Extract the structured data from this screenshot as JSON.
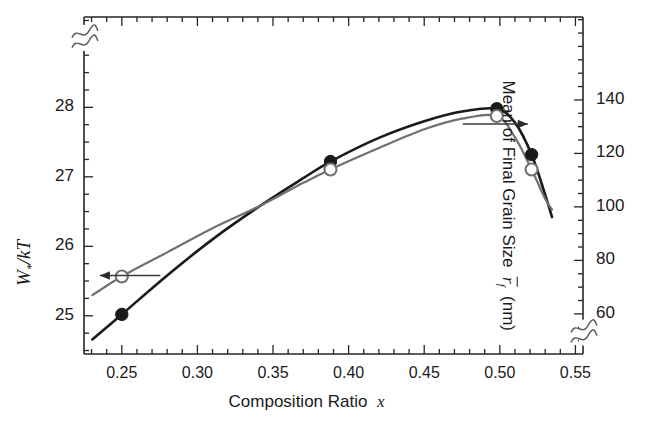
{
  "figure": {
    "background": "#ffffff",
    "axis_color": "#262626",
    "series_colors": {
      "left_axis_curve": "#1a1a1a",
      "right_axis_curve": "#707070"
    }
  },
  "chart_data": {
    "type": "line",
    "title": "",
    "subtitle": "",
    "xlabel_prefix": "Composition Ratio",
    "xlabel_symbol": "x",
    "xlim": [
      0.225,
      0.555
    ],
    "xticks": [
      0.25,
      0.3,
      0.35,
      0.4,
      0.45,
      0.5,
      0.55
    ],
    "xticklabels": [
      "0.25",
      "0.30",
      "0.35",
      "0.40",
      "0.45",
      "0.50",
      "0.55"
    ],
    "x_minor_tick_step": 0.01,
    "grid": false,
    "legend": "none",
    "axis_break_left": true,
    "axis_break_right": true,
    "left_axis": {
      "ylabel_plain": "W*/kT",
      "ylabel_base": "W",
      "ylabel_sub": "*",
      "ylabel_rest": "/kT",
      "ylim": [
        24.45,
        29.3
      ],
      "yticks": [
        25,
        26,
        27,
        28
      ],
      "yticklabels": [
        "25",
        "26",
        "27",
        "28"
      ],
      "y_minor_tick_step": 0.25,
      "break_value": 29.0
    },
    "right_axis": {
      "ylabel_prefix": "Mean of Final Grain Size",
      "ylabel_symbol_base": "r",
      "ylabel_symbol_sub": "f",
      "ylabel_symbol_overbar": true,
      "ylabel_units": "(nm)",
      "ylim": [
        45,
        171
      ],
      "yticks": [
        60,
        80,
        100,
        120,
        140
      ],
      "yticklabels": [
        "60",
        "80",
        "100",
        "120",
        "140"
      ],
      "y_minor_tick_step": 5,
      "break_value": 53
    },
    "series": [
      {
        "name": "W*/kT",
        "axis": "left",
        "marker": "filled-circle",
        "color": "#1a1a1a",
        "linewidth": 2.6,
        "annotation_arrow": "left-arrow",
        "marker_points": [
          {
            "x": 0.25,
            "y": 25.02
          },
          {
            "x": 0.388,
            "y": 27.22
          },
          {
            "x": 0.498,
            "y": 27.98
          },
          {
            "x": 0.521,
            "y": 27.32
          }
        ],
        "curve_points": [
          {
            "x": 0.2305,
            "y": 24.66
          },
          {
            "x": 0.25,
            "y": 25.02
          },
          {
            "x": 0.28,
            "y": 25.58
          },
          {
            "x": 0.31,
            "y": 26.1
          },
          {
            "x": 0.34,
            "y": 26.56
          },
          {
            "x": 0.37,
            "y": 26.98
          },
          {
            "x": 0.388,
            "y": 27.22
          },
          {
            "x": 0.42,
            "y": 27.56
          },
          {
            "x": 0.45,
            "y": 27.8
          },
          {
            "x": 0.475,
            "y": 27.94
          },
          {
            "x": 0.498,
            "y": 27.98
          },
          {
            "x": 0.51,
            "y": 27.78
          },
          {
            "x": 0.521,
            "y": 27.32
          },
          {
            "x": 0.53,
            "y": 26.74
          },
          {
            "x": 0.5345,
            "y": 26.42
          }
        ]
      },
      {
        "name": "Mean of Final Grain Size",
        "axis": "right",
        "marker": "open-circle",
        "color": "#707070",
        "linewidth": 2.2,
        "annotation_arrow": "right-arrow",
        "marker_points": [
          {
            "x": 0.25,
            "y": 74
          },
          {
            "x": 0.388,
            "y": 114
          },
          {
            "x": 0.498,
            "y": 134
          },
          {
            "x": 0.521,
            "y": 114
          }
        ],
        "curve_points": [
          {
            "x": 0.2305,
            "y": 67
          },
          {
            "x": 0.25,
            "y": 74
          },
          {
            "x": 0.28,
            "y": 83
          },
          {
            "x": 0.31,
            "y": 92
          },
          {
            "x": 0.34,
            "y": 100
          },
          {
            "x": 0.37,
            "y": 109
          },
          {
            "x": 0.388,
            "y": 114
          },
          {
            "x": 0.42,
            "y": 122
          },
          {
            "x": 0.45,
            "y": 129
          },
          {
            "x": 0.475,
            "y": 133
          },
          {
            "x": 0.498,
            "y": 134
          },
          {
            "x": 0.51,
            "y": 126
          },
          {
            "x": 0.521,
            "y": 114
          },
          {
            "x": 0.53,
            "y": 103
          },
          {
            "x": 0.5345,
            "y": 99
          }
        ]
      }
    ],
    "annotations": [
      {
        "name": "left-arrow",
        "points_to": "left-axis",
        "x_from": 0.2355,
        "x_to": 0.2755,
        "y_left_axis": 25.58
      },
      {
        "name": "right-arrow",
        "points_to": "right-axis",
        "x_from": 0.4755,
        "x_to": 0.5185,
        "y_right_axis": 131
      }
    ]
  }
}
